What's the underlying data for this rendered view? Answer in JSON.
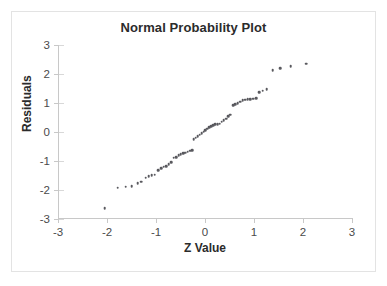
{
  "chart_data": {
    "type": "scatter",
    "title": "Normal Probability Plot",
    "xlabel": "Z Value",
    "ylabel": "Residuals",
    "xlim": [
      -3,
      3
    ],
    "ylim": [
      -3,
      3
    ],
    "xticks": [
      -3,
      -2,
      -1,
      0,
      1,
      2,
      3
    ],
    "yticks": [
      -3,
      -2,
      -1,
      0,
      1,
      2,
      3
    ],
    "xtick_labels": [
      "-3",
      "-2",
      "-1",
      "0",
      "1",
      "2",
      "3"
    ],
    "ytick_labels": [
      "-3",
      "-2",
      "-1",
      "0",
      "1",
      "2",
      "3"
    ],
    "grid": false,
    "legend": null,
    "marker_color": "#59595e",
    "axis_color": "#c8c8c8",
    "series": [
      {
        "name": "Residuals vs Z Value",
        "points": [
          [
            -2.05,
            -2.62
          ],
          [
            -1.78,
            -1.92
          ],
          [
            -1.62,
            -1.89
          ],
          [
            -1.5,
            -1.86
          ],
          [
            -1.37,
            -1.76
          ],
          [
            -1.3,
            -1.72
          ],
          [
            -1.21,
            -1.57
          ],
          [
            -1.15,
            -1.52
          ],
          [
            -1.09,
            -1.49
          ],
          [
            -1.03,
            -1.47
          ],
          [
            -0.95,
            -1.31
          ],
          [
            -0.89,
            -1.25
          ],
          [
            -0.84,
            -1.2
          ],
          [
            -0.79,
            -1.17
          ],
          [
            -0.74,
            -1.12
          ],
          [
            -0.69,
            -1.05
          ],
          [
            -0.64,
            -0.89
          ],
          [
            -0.59,
            -0.86
          ],
          [
            -0.54,
            -0.79
          ],
          [
            -0.5,
            -0.76
          ],
          [
            -0.45,
            -0.74
          ],
          [
            -0.4,
            -0.72
          ],
          [
            -0.35,
            -0.68
          ],
          [
            -0.3,
            -0.65
          ],
          [
            -0.26,
            -0.63
          ],
          [
            -0.23,
            -0.24
          ],
          [
            -0.19,
            -0.19
          ],
          [
            -0.15,
            -0.15
          ],
          [
            -0.11,
            -0.1
          ],
          [
            -0.07,
            -0.04
          ],
          [
            -0.03,
            0.01
          ],
          [
            0.01,
            0.07
          ],
          [
            0.05,
            0.12
          ],
          [
            0.09,
            0.17
          ],
          [
            0.13,
            0.21
          ],
          [
            0.17,
            0.24
          ],
          [
            0.21,
            0.26
          ],
          [
            0.26,
            0.27
          ],
          [
            0.3,
            0.29
          ],
          [
            0.34,
            0.35
          ],
          [
            0.38,
            0.41
          ],
          [
            0.43,
            0.46
          ],
          [
            0.47,
            0.54
          ],
          [
            0.52,
            0.6
          ],
          [
            0.57,
            0.92
          ],
          [
            0.62,
            0.96
          ],
          [
            0.67,
            1.0
          ],
          [
            0.72,
            1.05
          ],
          [
            0.77,
            1.1
          ],
          [
            0.82,
            1.12
          ],
          [
            0.87,
            1.13
          ],
          [
            0.92,
            1.14
          ],
          [
            0.98,
            1.15
          ],
          [
            1.04,
            1.17
          ],
          [
            1.11,
            1.37
          ],
          [
            1.18,
            1.42
          ],
          [
            1.26,
            1.47
          ],
          [
            1.38,
            2.13
          ],
          [
            1.53,
            2.2
          ],
          [
            1.75,
            2.27
          ],
          [
            2.07,
            2.35
          ]
        ]
      }
    ]
  }
}
